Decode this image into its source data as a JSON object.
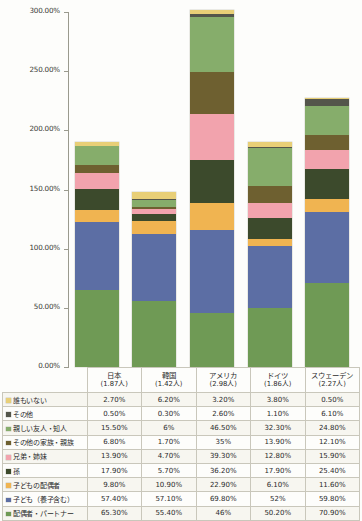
{
  "chart_data": {
    "type": "bar",
    "stacked": true,
    "title": "",
    "xlabel": "",
    "ylabel": "",
    "ylim": [
      0,
      300
    ],
    "ytick_labels": [
      "0.00%",
      "50.00%",
      "100.00%",
      "150.00%",
      "200.00%",
      "250.00%",
      "300.00%"
    ],
    "ytick_values": [
      0,
      50,
      100,
      150,
      200,
      250,
      300
    ],
    "grid": false,
    "legend_position": "table-row-labels",
    "categories": [
      "日本",
      "韓国",
      "アメリカ",
      "ドイツ",
      "スウェーデン"
    ],
    "category_sublabels": [
      "(1.87人)",
      "(1.42人)",
      "(2.98人)",
      "(1.86人)",
      "(2.27人)"
    ],
    "series": [
      {
        "name": "配偶者・パートナー",
        "color": "#6f9a55",
        "values": [
          65.3,
          55.4,
          46.0,
          50.2,
          70.9
        ],
        "display": [
          "65.30%",
          "55.40%",
          "46%",
          "50.20%",
          "70.90%"
        ]
      },
      {
        "name": "子ども（養子含む）",
        "color": "#5c6ea4",
        "values": [
          57.4,
          57.1,
          69.8,
          52.0,
          59.8
        ],
        "display": [
          "57.40%",
          "57.10%",
          "69.80%",
          "52%",
          "59.80%"
        ]
      },
      {
        "name": "子どもの配偶者",
        "color": "#f0b451",
        "values": [
          9.8,
          10.9,
          22.9,
          6.1,
          11.6
        ],
        "display": [
          "9.80%",
          "10.90%",
          "22.90%",
          "6.10%",
          "11.60%"
        ]
      },
      {
        "name": "孫",
        "color": "#3c4a2c",
        "values": [
          17.9,
          5.7,
          36.2,
          17.9,
          25.4
        ],
        "display": [
          "17.90%",
          "5.70%",
          "36.20%",
          "17.90%",
          "25.40%"
        ]
      },
      {
        "name": "兄弟・姉妹",
        "color": "#f2a3ad",
        "values": [
          13.9,
          4.7,
          39.3,
          12.8,
          15.9
        ],
        "display": [
          "13.90%",
          "4.70%",
          "39.30%",
          "12.80%",
          "15.90%"
        ]
      },
      {
        "name": "その他の家族・親族",
        "color": "#6e6030",
        "values": [
          6.8,
          1.7,
          35.0,
          13.9,
          12.1
        ],
        "display": [
          "6.80%",
          "1.70%",
          "35%",
          "13.90%",
          "12.10%"
        ]
      },
      {
        "name": "親しい友人・知人",
        "color": "#86ad6b",
        "values": [
          15.5,
          6.0,
          46.5,
          32.3,
          24.8
        ],
        "display": [
          "15.50%",
          "6%",
          "46.50%",
          "32.30%",
          "24.80%"
        ]
      },
      {
        "name": "その他",
        "color": "#54564b",
        "values": [
          0.5,
          0.3,
          2.6,
          1.1,
          6.1
        ],
        "display": [
          "0.50%",
          "0.30%",
          "2.60%",
          "1.10%",
          "6.10%"
        ]
      },
      {
        "name": "誰もいない",
        "color": "#e8cf77",
        "values": [
          2.7,
          6.2,
          3.2,
          3.8,
          0.5
        ],
        "display": [
          "2.70%",
          "6.20%",
          "3.20%",
          "3.80%",
          "0.50%"
        ]
      }
    ]
  },
  "table": {
    "header_blank": "",
    "columns": [
      {
        "name": "日本",
        "sub": "(1.87人)"
      },
      {
        "name": "韓国",
        "sub": "(1.42人)"
      },
      {
        "name": "アメリカ",
        "sub": "(2.98人)"
      },
      {
        "name": "ドイツ",
        "sub": "(1.86人)"
      },
      {
        "name": "スウェーデン",
        "sub": "(2.27人)"
      }
    ],
    "rows": [
      {
        "label": "誰もいない",
        "color": "#e8cf77",
        "cells": [
          "2.70%",
          "6.20%",
          "3.20%",
          "3.80%",
          "0.50%"
        ]
      },
      {
        "label": "その他",
        "color": "#54564b",
        "cells": [
          "0.50%",
          "0.30%",
          "2.60%",
          "1.10%",
          "6.10%"
        ]
      },
      {
        "label": "親しい友人・知人",
        "color": "#86ad6b",
        "cells": [
          "15.50%",
          "6%",
          "46.50%",
          "32.30%",
          "24.80%"
        ]
      },
      {
        "label": "その他の家族・親族",
        "color": "#6e6030",
        "cells": [
          "6.80%",
          "1.70%",
          "35%",
          "13.90%",
          "12.10%"
        ]
      },
      {
        "label": "兄弟・姉妹",
        "color": "#f2a3ad",
        "cells": [
          "13.90%",
          "4.70%",
          "39.30%",
          "12.80%",
          "15.90%"
        ]
      },
      {
        "label": "孫",
        "color": "#3c4a2c",
        "cells": [
          "17.90%",
          "5.70%",
          "36.20%",
          "17.90%",
          "25.40%"
        ]
      },
      {
        "label": "子どもの配偶者",
        "color": "#f0b451",
        "cells": [
          "9.80%",
          "10.90%",
          "22.90%",
          "6.10%",
          "11.60%"
        ]
      },
      {
        "label": "子ども（養子含む）",
        "color": "#5c6ea4",
        "cells": [
          "57.40%",
          "57.10%",
          "69.80%",
          "52%",
          "59.80%"
        ]
      },
      {
        "label": "配偶者・パートナー",
        "color": "#6f9a55",
        "cells": [
          "65.30%",
          "55.40%",
          "46%",
          "50.20%",
          "70.90%"
        ]
      }
    ]
  }
}
